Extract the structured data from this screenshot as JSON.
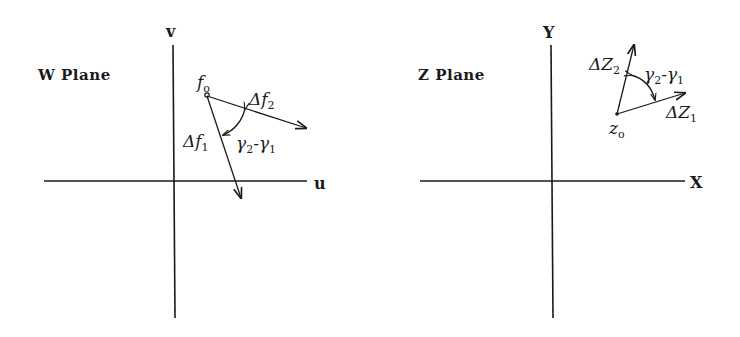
{
  "w_plane": {
    "title": "W Plane",
    "axis_horizontal": "u",
    "axis_vertical": "v",
    "origin_point": {
      "label": "f",
      "sub": "o"
    },
    "vector_1": {
      "label": "Δf",
      "sub": "1"
    },
    "vector_2": {
      "label": "Δf",
      "sub": "2"
    },
    "angle": {
      "g2": "γ",
      "g2_sub": "2",
      "minus": "-",
      "g1": "γ",
      "g1_sub": "1"
    }
  },
  "z_plane": {
    "title": "Z Plane",
    "axis_horizontal": "X",
    "axis_vertical": "Y",
    "origin_point": {
      "label": "z",
      "sub": "o"
    },
    "vector_1": {
      "label": "ΔZ",
      "sub": "1"
    },
    "vector_2": {
      "label": "ΔZ",
      "sub": "2"
    },
    "angle": {
      "g2": "γ",
      "g2_sub": "2",
      "minus": "-",
      "g1": "γ",
      "g1_sub": "1"
    }
  },
  "colors": {
    "ink": "#1a1a1a",
    "background": "#ffffff"
  }
}
